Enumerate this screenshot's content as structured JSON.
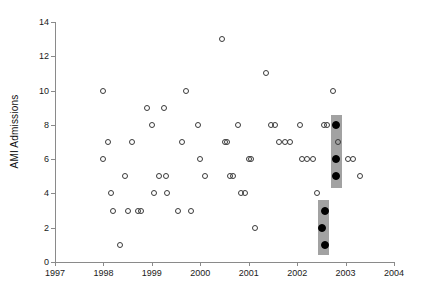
{
  "chart_data": {
    "type": "scatter",
    "title": "",
    "xlabel": "",
    "ylabel": "AMI Admissions",
    "xlim": [
      1997,
      2004
    ],
    "ylim": [
      0,
      14
    ],
    "xticks": [
      1997,
      1998,
      1999,
      2000,
      2001,
      2002,
      2003,
      2004
    ],
    "xticklabels": [
      "1997",
      "1998",
      "1999",
      "2000",
      "2001",
      "2002",
      "2003",
      "2004"
    ],
    "yticks": [
      0,
      2,
      4,
      6,
      8,
      10,
      12,
      14
    ],
    "yticklabels": [
      "0",
      "2",
      "4",
      "6",
      "8",
      "10",
      "12",
      "14"
    ],
    "grid": false,
    "legend": null,
    "marker_style_open": "open-circle",
    "marker_style_filled": "filled-circle",
    "series": [
      {
        "name": "AMI admissions (routine)",
        "marker": "open-circle",
        "points": [
          [
            1998.0,
            10
          ],
          [
            1998.0,
            6
          ],
          [
            1998.1,
            7
          ],
          [
            1998.15,
            4
          ],
          [
            1998.2,
            3
          ],
          [
            1998.35,
            1
          ],
          [
            1998.45,
            5
          ],
          [
            1998.5,
            3
          ],
          [
            1998.6,
            7
          ],
          [
            1998.72,
            3
          ],
          [
            1998.78,
            3
          ],
          [
            1998.9,
            9
          ],
          [
            1999.0,
            8
          ],
          [
            1999.05,
            4
          ],
          [
            1999.15,
            5
          ],
          [
            1999.25,
            9
          ],
          [
            1999.3,
            5
          ],
          [
            1999.32,
            4
          ],
          [
            1999.55,
            3
          ],
          [
            1999.62,
            7
          ],
          [
            1999.7,
            10
          ],
          [
            1999.8,
            3
          ],
          [
            1999.95,
            8
          ],
          [
            2000.0,
            6
          ],
          [
            2000.1,
            5
          ],
          [
            2000.45,
            13
          ],
          [
            2000.5,
            7
          ],
          [
            2000.55,
            7
          ],
          [
            2000.62,
            5
          ],
          [
            2000.68,
            5
          ],
          [
            2000.78,
            8
          ],
          [
            2000.85,
            4
          ],
          [
            2000.92,
            4
          ],
          [
            2001.0,
            6
          ],
          [
            2001.05,
            6
          ],
          [
            2001.12,
            2
          ],
          [
            2001.35,
            11
          ],
          [
            2001.45,
            8
          ],
          [
            2001.55,
            8
          ],
          [
            2001.62,
            7
          ],
          [
            2001.75,
            7
          ],
          [
            2001.85,
            7
          ],
          [
            2002.05,
            8
          ],
          [
            2002.1,
            6
          ],
          [
            2002.2,
            6
          ],
          [
            2002.32,
            6
          ],
          [
            2002.42,
            4
          ],
          [
            2002.55,
            8
          ],
          [
            2002.62,
            8
          ],
          [
            2002.75,
            10
          ],
          [
            2002.85,
            7
          ],
          [
            2003.05,
            6
          ],
          [
            2003.15,
            6
          ],
          [
            2003.3,
            5
          ]
        ]
      },
      {
        "name": "Highlighted admissions",
        "marker": "filled-circle",
        "points": [
          [
            2002.8,
            8
          ],
          [
            2002.8,
            6
          ],
          [
            2002.8,
            5
          ],
          [
            2002.58,
            3
          ],
          [
            2002.52,
            2
          ],
          [
            2002.58,
            1
          ]
        ]
      }
    ],
    "highlight_boxes": [
      {
        "name": "upper-highlight-box",
        "x0": 2002.7,
        "x1": 2002.92,
        "y0": 4.3,
        "y1": 8.6,
        "color": "#9a9a9a"
      },
      {
        "name": "lower-highlight-box",
        "x0": 2002.44,
        "x1": 2002.66,
        "y0": 0.4,
        "y1": 3.6,
        "color": "#9a9a9a"
      }
    ],
    "axis_color": "#8a8a8a",
    "marker_outline_color": "#3a3a3a",
    "marker_fill_color": "#000000"
  }
}
